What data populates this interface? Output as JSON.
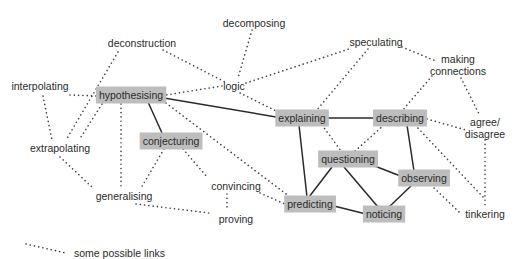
{
  "diagram": {
    "type": "concept-map",
    "colors": {
      "box_fill": "#bdbdbd",
      "text": "#2b2b2b",
      "solid_line": "#2a2a2a",
      "dotted_line": "#444444",
      "background": "#ffffff"
    },
    "nodes": [
      {
        "id": "decomposing",
        "label": "decomposing",
        "boxed": false,
        "x": 254,
        "y": 23
      },
      {
        "id": "deconstruction",
        "label": "deconstruction",
        "boxed": false,
        "x": 142,
        "y": 43
      },
      {
        "id": "speculating",
        "label": "speculating",
        "boxed": false,
        "x": 376,
        "y": 42
      },
      {
        "id": "making_connections",
        "label": "making connections",
        "lines": [
          "making",
          "connections"
        ],
        "boxed": false,
        "x": 458,
        "y": 65
      },
      {
        "id": "logic",
        "label": "logic",
        "boxed": false,
        "x": 234,
        "y": 86
      },
      {
        "id": "interpolating",
        "label": "interpolating",
        "boxed": false,
        "x": 40,
        "y": 86
      },
      {
        "id": "hypothesising",
        "label": "hypothesising",
        "boxed": true,
        "x": 131,
        "y": 95
      },
      {
        "id": "explaining",
        "label": "explaining",
        "boxed": true,
        "x": 302,
        "y": 118
      },
      {
        "id": "describing",
        "label": "describing",
        "boxed": true,
        "x": 400,
        "y": 118
      },
      {
        "id": "agree_disagree",
        "label": "agree/ disagree",
        "lines": [
          "agree/",
          "disagree"
        ],
        "boxed": false,
        "x": 485,
        "y": 128
      },
      {
        "id": "extrapolating",
        "label": "extrapolating",
        "boxed": false,
        "x": 60,
        "y": 148
      },
      {
        "id": "conjecturing",
        "label": "conjecturing",
        "boxed": true,
        "x": 171,
        "y": 141
      },
      {
        "id": "questioning",
        "label": "questioning",
        "boxed": true,
        "x": 348,
        "y": 159
      },
      {
        "id": "observing",
        "label": "observing",
        "boxed": true,
        "x": 424,
        "y": 178
      },
      {
        "id": "convincing",
        "label": "convincing",
        "boxed": false,
        "x": 236,
        "y": 186
      },
      {
        "id": "generalising",
        "label": "generalising",
        "boxed": false,
        "x": 124,
        "y": 196
      },
      {
        "id": "predicting",
        "label": "predicting",
        "boxed": true,
        "x": 310,
        "y": 204
      },
      {
        "id": "noticing",
        "label": "noticing",
        "boxed": true,
        "x": 384,
        "y": 214
      },
      {
        "id": "tinkering",
        "label": "tinkering",
        "boxed": false,
        "x": 485,
        "y": 214
      },
      {
        "id": "proving",
        "label": "proving",
        "boxed": false,
        "x": 236,
        "y": 219
      }
    ],
    "edges_solid": [
      {
        "from": "hypothesising",
        "to": "explaining",
        "points": [
          164,
          98,
          276,
          117
        ]
      },
      {
        "from": "hypothesising",
        "to": "conjecturing",
        "points": [
          148,
          102,
          162,
          133
        ]
      },
      {
        "from": "explaining",
        "to": "describing",
        "points": [
          327,
          118,
          375,
          118
        ]
      },
      {
        "from": "explaining",
        "to": "predicting",
        "points": [
          299,
          125,
          307,
          197
        ]
      },
      {
        "from": "describing",
        "to": "observing",
        "points": [
          407,
          125,
          414,
          171
        ]
      },
      {
        "from": "questioning",
        "to": "predicting",
        "points": [
          332,
          167,
          309,
          197
        ]
      },
      {
        "from": "questioning",
        "to": "noticing",
        "points": [
          344,
          167,
          378,
          207
        ]
      },
      {
        "from": "questioning",
        "to": "observing",
        "points": [
          367,
          163,
          403,
          177
        ]
      },
      {
        "from": "observing",
        "to": "noticing",
        "points": [
          412,
          185,
          389,
          207
        ]
      },
      {
        "from": "predicting",
        "to": "noticing",
        "points": [
          334,
          206,
          366,
          214
        ]
      }
    ],
    "edges_dotted": [
      {
        "from": "deconstruction",
        "to": "logic",
        "points": [
          163,
          50,
          225,
          82
        ]
      },
      {
        "from": "deconstruction",
        "to": "extrapolating",
        "points": [
          118,
          52,
          66,
          140
        ]
      },
      {
        "from": "decomposing",
        "to": "logic",
        "points": [
          252,
          30,
          238,
          78
        ]
      },
      {
        "from": "logic",
        "to": "hypothesising",
        "points": [
          222,
          86,
          166,
          95
        ]
      },
      {
        "from": "logic",
        "to": "speculating",
        "points": [
          246,
          83,
          352,
          48
        ]
      },
      {
        "from": "logic",
        "to": "explaining",
        "points": [
          240,
          93,
          280,
          113
        ]
      },
      {
        "from": "speculating",
        "to": "explaining",
        "points": [
          368,
          49,
          316,
          111
        ]
      },
      {
        "from": "speculating",
        "to": "making_connections",
        "points": [
          402,
          47,
          436,
          61
        ]
      },
      {
        "from": "making_connections",
        "to": "describing",
        "points": [
          432,
          76,
          402,
          111
        ]
      },
      {
        "from": "making_connections",
        "to": "agree_disagree",
        "points": [
          461,
          78,
          480,
          116
        ]
      },
      {
        "from": "interpolating",
        "to": "hypothesising",
        "points": [
          70,
          95,
          96,
          96
        ]
      },
      {
        "from": "interpolating",
        "to": "extrapolating",
        "points": [
          43,
          96,
          52,
          140
        ]
      },
      {
        "from": "hypothesising",
        "to": "extrapolating",
        "points": [
          102,
          104,
          79,
          140
        ]
      },
      {
        "from": "hypothesising",
        "to": "generalising",
        "points": [
          121,
          104,
          121,
          188
        ]
      },
      {
        "from": "hypothesising",
        "to": "predicting",
        "points": [
          166,
          103,
          290,
          197
        ]
      },
      {
        "from": "extrapolating",
        "to": "generalising",
        "points": [
          60,
          157,
          93,
          188
        ]
      },
      {
        "from": "conjecturing",
        "to": "generalising",
        "points": [
          164,
          149,
          141,
          188
        ]
      },
      {
        "from": "conjecturing",
        "to": "convincing",
        "points": [
          183,
          149,
          208,
          178
        ]
      },
      {
        "from": "convincing",
        "to": "predicting",
        "points": [
          260,
          193,
          285,
          204
        ]
      },
      {
        "from": "convincing",
        "to": "proving",
        "points": [
          227,
          194,
          227,
          211
        ]
      },
      {
        "from": "generalising",
        "to": "proving",
        "points": [
          136,
          204,
          209,
          213
        ]
      },
      {
        "from": "explaining",
        "to": "questioning",
        "points": [
          322,
          125,
          341,
          151
        ]
      },
      {
        "from": "describing",
        "to": "questioning",
        "points": [
          384,
          125,
          355,
          151
        ]
      },
      {
        "from": "describing",
        "to": "agree_disagree",
        "points": [
          427,
          119,
          466,
          130
        ]
      },
      {
        "from": "describing",
        "to": "tinkering",
        "points": [
          415,
          125,
          484,
          198
        ]
      },
      {
        "from": "agree_disagree",
        "to": "tinkering",
        "points": [
          485,
          140,
          485,
          205
        ]
      },
      {
        "from": "observing",
        "to": "tinkering",
        "points": [
          431,
          185,
          460,
          213
        ]
      }
    ],
    "legend": {
      "label": "some possible links",
      "line_points": [
        26,
        244,
        66,
        253
      ],
      "text_x": 74,
      "text_y": 257
    }
  }
}
